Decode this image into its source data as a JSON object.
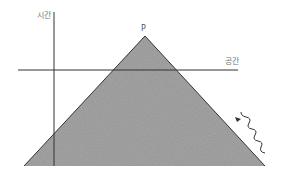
{
  "diagram": {
    "title": "",
    "labels": {
      "time_axis": "시간",
      "space_axis": "공간",
      "apex_point": "P"
    },
    "elements": {
      "light_cone": {
        "shape": "triangle",
        "fill": "#9a9a9a",
        "apex": [
          145,
          36
        ],
        "base_left": [
          24,
          166
        ],
        "base_right": [
          265,
          166
        ]
      },
      "time_axis": {
        "x": 54,
        "y_top": 12,
        "y_bottom": 166
      },
      "space_axis": {
        "y": 70,
        "x_left": 18,
        "x_right": 238
      },
      "wave_arrow": {
        "direction": "up-left",
        "from": [
          265,
          153
        ],
        "to": [
          235,
          117
        ]
      }
    },
    "colors": {
      "cone_fill": "#9a9a9a",
      "line": "#333333",
      "label": "#777777"
    }
  }
}
